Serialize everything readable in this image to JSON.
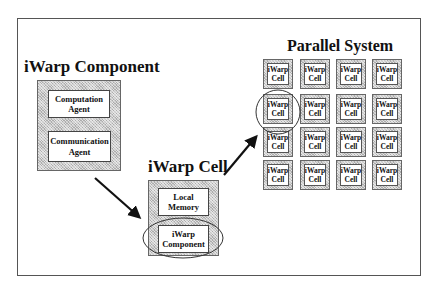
{
  "diagram": {
    "component": {
      "title": "iWarp Component",
      "agents": [
        {
          "line1": "Computation",
          "line2": "Agent"
        },
        {
          "line1": "Communication",
          "line2": "Agent"
        }
      ]
    },
    "cell": {
      "title": "iWarp Cell",
      "parts": [
        {
          "line1": "Local",
          "line2": "Memory"
        },
        {
          "line1": "iWarp",
          "line2": "Component",
          "highlighted": true
        }
      ]
    },
    "system": {
      "title": "Parallel System",
      "rows": 4,
      "cols": 4,
      "cell_line1": "iWarp",
      "cell_line2": "Cell",
      "highlighted_cell": {
        "row": 1,
        "col": 0
      }
    },
    "arrows": [
      {
        "from": "iWarp Component",
        "to": "iWarp Cell"
      },
      {
        "from": "iWarp Cell",
        "to": "Parallel System"
      }
    ],
    "colors": {
      "hatch_fill": "#c9c9c9",
      "border": "#555555",
      "arrow": "#111111"
    }
  }
}
